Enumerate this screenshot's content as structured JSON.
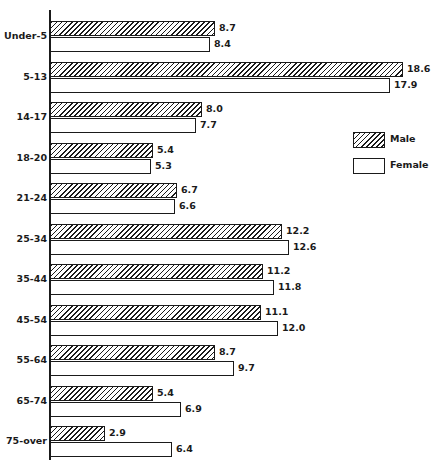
{
  "chart_data": {
    "type": "bar",
    "orientation": "horizontal",
    "title": "",
    "xlabel": "",
    "ylabel": "",
    "categories": [
      "Under-5",
      "5-13",
      "14-17",
      "18-20",
      "21-24",
      "25-34",
      "35-44",
      "45-54",
      "55-64",
      "65-74",
      "75-over"
    ],
    "series": [
      {
        "name": "Male",
        "pattern": "diagonal-hatch",
        "values": [
          8.7,
          18.6,
          8.0,
          5.4,
          6.7,
          12.2,
          11.2,
          11.1,
          8.7,
          5.4,
          2.9
        ]
      },
      {
        "name": "Female",
        "pattern": "white",
        "values": [
          8.4,
          17.9,
          7.7,
          5.3,
          6.6,
          12.6,
          11.8,
          12.0,
          9.7,
          6.9,
          6.4
        ]
      }
    ],
    "xlim": [
      0,
      19
    ],
    "grid": false,
    "legend_position": "right",
    "data_labels": true
  },
  "legend": {
    "male_label": "Male",
    "female_label": "Female"
  },
  "colors": {
    "ink": "#1a1a1a",
    "background": "#ffffff"
  }
}
